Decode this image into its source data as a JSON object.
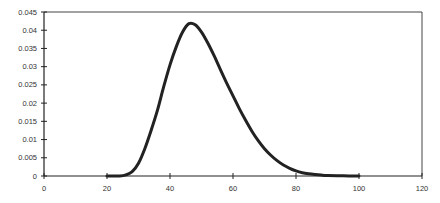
{
  "chart_data": {
    "type": "line",
    "title": "",
    "xlabel": "",
    "ylabel": "",
    "xlim": [
      0,
      120
    ],
    "ylim": [
      0,
      0.045
    ],
    "grid": false,
    "legend": "none",
    "x_ticks": [
      "0",
      "20",
      "40",
      "60",
      "80",
      "100",
      "120"
    ],
    "y_ticks": [
      "0",
      "0.005",
      "0.01",
      "0.015",
      "0.02",
      "0.025",
      "0.03",
      "0.035",
      "0.04",
      "0.045"
    ],
    "series": [
      {
        "name": "density",
        "color": "#222222",
        "x": [
          20,
          24,
          26,
          28,
          30,
          32,
          34,
          36,
          38,
          40,
          42,
          44,
          46,
          48,
          50,
          52,
          54,
          56,
          58,
          60,
          62,
          64,
          66,
          68,
          70,
          72,
          74,
          76,
          78,
          80,
          82,
          84,
          86,
          88,
          90,
          95,
          100
        ],
        "y": [
          0,
          0,
          0.0003,
          0.0012,
          0.0035,
          0.0075,
          0.0125,
          0.018,
          0.0245,
          0.0305,
          0.0355,
          0.0395,
          0.0418,
          0.0415,
          0.0395,
          0.0365,
          0.033,
          0.0292,
          0.0255,
          0.022,
          0.0185,
          0.0153,
          0.0123,
          0.0097,
          0.0075,
          0.0057,
          0.0042,
          0.003,
          0.0021,
          0.0014,
          0.0009,
          0.0006,
          0.0004,
          0.00025,
          0.00015,
          5e-05,
          0
        ]
      }
    ]
  }
}
